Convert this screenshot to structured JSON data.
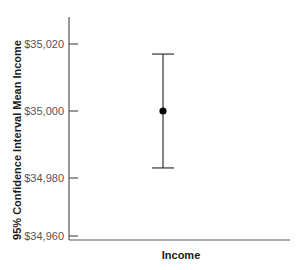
{
  "chart_data": {
    "type": "errorbar",
    "title": "",
    "xlabel": "Income",
    "ylabel": "95% Confidence Interval Mean Income",
    "categories": [
      "Income"
    ],
    "series": [
      {
        "name": "Income",
        "mean": [
          35000
        ],
        "ci_lower": [
          34983
        ],
        "ci_upper": [
          35017
        ]
      }
    ],
    "ylim": [
      34958,
      35028
    ],
    "yticks": [
      34960,
      34980,
      35000,
      35020
    ],
    "ytick_labels": [
      "$34,960",
      "$34,980",
      "$35,000",
      "$35,020"
    ],
    "grid": false,
    "legend": null
  },
  "colors": {
    "axis": "#555555",
    "errorbar": "#333333",
    "marker": "#000000",
    "tick_label": "#555555",
    "axis_title": "#1a1a1a"
  },
  "layout": {
    "plot_left": 69,
    "plot_right": 290,
    "plot_top": 17,
    "plot_bottom": 230,
    "ytick_pixels": [
      236,
      178,
      111,
      44
    ]
  }
}
